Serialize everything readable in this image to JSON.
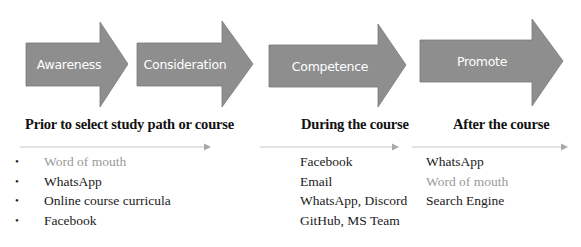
{
  "colors": {
    "arrow_fill": "#8e8e8e",
    "arrow_stroke": "#7a7a7a",
    "arrow_text": "#ffffff",
    "separator": "#c8c8c8",
    "separator_head": "#a8a8a8",
    "text": "#1a1a1a",
    "muted_text": "#9a9a9a"
  },
  "stages": [
    {
      "label": "Awareness"
    },
    {
      "label": "Consideration"
    },
    {
      "label": "Competence"
    },
    {
      "label": "Promote"
    }
  ],
  "phases": [
    {
      "heading": "Prior to select study path or course",
      "bulleted": true,
      "items": [
        {
          "text": "Word of mouth",
          "muted": true
        },
        {
          "text": "WhatsApp",
          "muted": false
        },
        {
          "text": "Online course curricula",
          "muted": false
        },
        {
          "text": "Facebook",
          "muted": false
        }
      ]
    },
    {
      "heading": "During the course",
      "bulleted": false,
      "items": [
        {
          "text": "Facebook",
          "muted": false
        },
        {
          "text": "Email",
          "muted": false
        },
        {
          "text": "WhatsApp, Discord",
          "muted": false
        },
        {
          "text": "GitHub, MS Team",
          "muted": false
        }
      ]
    },
    {
      "heading": "After the course",
      "bulleted": false,
      "items": [
        {
          "text": "WhatsApp",
          "muted": false
        },
        {
          "text": "Word of mouth",
          "muted": true
        },
        {
          "text": "Search Engine",
          "muted": false
        }
      ]
    }
  ],
  "bullet_glyph": "•"
}
